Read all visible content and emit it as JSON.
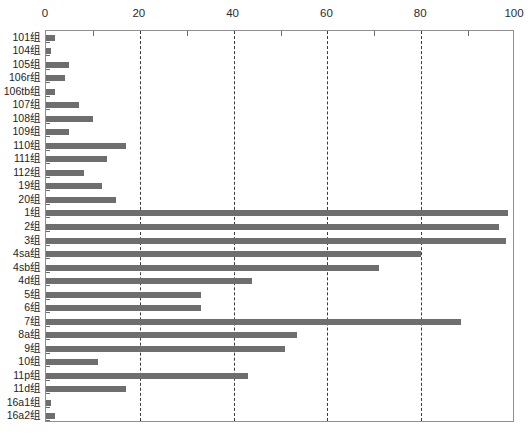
{
  "chart_data": {
    "type": "bar",
    "orientation": "horizontal",
    "title": "",
    "xlabel": "",
    "ylabel": "",
    "xlim": [
      0,
      100
    ],
    "ylim": null,
    "grid": true,
    "legend": false,
    "bar_color": "#6e6e6e",
    "axis_color": "#8f8f8f",
    "gridline_color": "#3a3a3a",
    "xticks": [
      0,
      20,
      40,
      60,
      80,
      100
    ],
    "xtick_labels": [
      "0",
      "20",
      "40",
      "60",
      "80",
      "100"
    ],
    "minor_xticks": [
      10,
      30,
      50,
      70,
      90
    ],
    "categories": [
      "101组",
      "104组",
      "105组",
      "106r组",
      "106tb组",
      "107组",
      "108组",
      "109组",
      "110组",
      "111组",
      "112组",
      "19组",
      "20组",
      "1组",
      "2组",
      "3组",
      "4sa组",
      "4sb组",
      "4d组",
      "5组",
      "6组",
      "7组",
      "8a组",
      "9组",
      "10组",
      "11p组",
      "11d组",
      "16a1组",
      "16a2组"
    ],
    "values": [
      2,
      1,
      5,
      4,
      2,
      7,
      10,
      5,
      17,
      13,
      8,
      12,
      15,
      98.5,
      96.5,
      98,
      80,
      71,
      44,
      33,
      33,
      88.5,
      53.5,
      51,
      11,
      43,
      17,
      1,
      2
    ]
  }
}
